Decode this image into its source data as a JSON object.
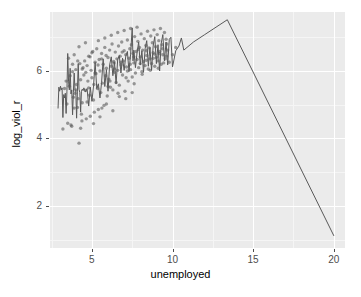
{
  "chart_data": {
    "type": "scatter",
    "title": "",
    "xlabel": "unemployed",
    "ylabel": "log_viol_r",
    "xlim": [
      2.4,
      20.7
    ],
    "ylim": [
      0.75,
      7.75
    ],
    "xticks": [
      5,
      10,
      15,
      20
    ],
    "yticks": [
      2,
      4,
      6
    ],
    "grid": true,
    "legend": "none",
    "theme": "grey",
    "panel_background": "#EBEBEB",
    "gridline_major_color": "#FFFFFF",
    "gridline_minor_color": "#F5F5F5",
    "point_color": "#4D4D4D",
    "point_opacity": 0.55,
    "point_radius": 1.7,
    "line_color": "#595959",
    "line_width": 1.0,
    "series": [
      {
        "name": "points",
        "type": "scatter",
        "points": [
          [
            3.2,
            4.28
          ],
          [
            3.45,
            5.02
          ],
          [
            3.5,
            4.45
          ],
          [
            3.55,
            6.38
          ],
          [
            3.6,
            5.55
          ],
          [
            3.7,
            4.4
          ],
          [
            3.75,
            4.36
          ],
          [
            3.8,
            5.98
          ],
          [
            3.85,
            5.22
          ],
          [
            3.9,
            6.48
          ],
          [
            3.95,
            5.34
          ],
          [
            4.0,
            6.04
          ],
          [
            4.05,
            5.6
          ],
          [
            4.1,
            4.92
          ],
          [
            4.15,
            5.18
          ],
          [
            4.2,
            3.86
          ],
          [
            4.25,
            6.22
          ],
          [
            4.3,
            5.74
          ],
          [
            4.35,
            4.72
          ],
          [
            4.4,
            5.06
          ],
          [
            4.45,
            6.1
          ],
          [
            4.5,
            5.88
          ],
          [
            4.55,
            6.3
          ],
          [
            4.6,
            5.42
          ],
          [
            4.65,
            4.58
          ],
          [
            4.7,
            6.16
          ],
          [
            4.75,
            5.7
          ],
          [
            4.8,
            6.44
          ],
          [
            4.85,
            5.28
          ],
          [
            4.9,
            4.66
          ],
          [
            4.95,
            6.02
          ],
          [
            5.0,
            5.8
          ],
          [
            5.05,
            6.58
          ],
          [
            5.1,
            5.14
          ],
          [
            5.15,
            4.78
          ],
          [
            5.2,
            6.26
          ],
          [
            5.25,
            5.92
          ],
          [
            5.3,
            6.66
          ],
          [
            5.35,
            5.48
          ],
          [
            5.4,
            4.86
          ],
          [
            5.45,
            6.34
          ],
          [
            5.5,
            6.0
          ],
          [
            5.55,
            5.36
          ],
          [
            5.6,
            6.52
          ],
          [
            5.65,
            5.64
          ],
          [
            5.7,
            6.2
          ],
          [
            5.75,
            4.98
          ],
          [
            5.8,
            6.7
          ],
          [
            5.85,
            5.86
          ],
          [
            5.9,
            6.08
          ],
          [
            5.95,
            5.26
          ],
          [
            6.0,
            6.4
          ],
          [
            6.05,
            5.76
          ],
          [
            6.1,
            6.62
          ],
          [
            6.15,
            5.52
          ],
          [
            6.2,
            6.14
          ],
          [
            6.25,
            6.8
          ],
          [
            6.3,
            5.44
          ],
          [
            6.35,
            6.28
          ],
          [
            6.4,
            5.96
          ],
          [
            6.45,
            6.56
          ],
          [
            6.5,
            5.66
          ],
          [
            6.55,
            6.36
          ],
          [
            6.6,
            6.02
          ],
          [
            6.65,
            6.74
          ],
          [
            6.7,
            5.58
          ],
          [
            6.75,
            6.44
          ],
          [
            6.8,
            6.18
          ],
          [
            6.85,
            6.86
          ],
          [
            6.9,
            5.88
          ],
          [
            6.95,
            6.3
          ],
          [
            7.0,
            6.6
          ],
          [
            7.05,
            5.4
          ],
          [
            7.1,
            6.48
          ],
          [
            7.15,
            6.12
          ],
          [
            7.2,
            6.92
          ],
          [
            7.25,
            5.7
          ],
          [
            7.3,
            6.38
          ],
          [
            7.35,
            6.66
          ],
          [
            7.4,
            6.04
          ],
          [
            7.45,
            6.78
          ],
          [
            7.5,
            5.82
          ],
          [
            7.55,
            6.52
          ],
          [
            7.6,
            6.24
          ],
          [
            7.65,
            7.02
          ],
          [
            7.7,
            5.94
          ],
          [
            7.75,
            6.58
          ],
          [
            7.8,
            6.34
          ],
          [
            7.85,
            6.88
          ],
          [
            7.9,
            6.1
          ],
          [
            7.95,
            6.7
          ],
          [
            8.0,
            6.42
          ],
          [
            8.05,
            7.1
          ],
          [
            8.1,
            5.98
          ],
          [
            8.15,
            6.62
          ],
          [
            8.2,
            6.28
          ],
          [
            8.25,
            6.96
          ],
          [
            8.3,
            6.16
          ],
          [
            8.35,
            6.76
          ],
          [
            8.4,
            6.46
          ],
          [
            8.45,
            7.18
          ],
          [
            8.5,
            6.06
          ],
          [
            8.55,
            6.68
          ],
          [
            8.6,
            6.36
          ],
          [
            8.65,
            7.04
          ],
          [
            8.7,
            6.22
          ],
          [
            8.75,
            6.84
          ],
          [
            8.8,
            6.54
          ],
          [
            8.85,
            7.22
          ],
          [
            8.9,
            6.14
          ],
          [
            8.95,
            6.72
          ],
          [
            9.0,
            6.4
          ],
          [
            9.05,
            7.08
          ],
          [
            9.1,
            6.3
          ],
          [
            9.15,
            6.9
          ],
          [
            9.2,
            6.58
          ],
          [
            9.25,
            7.26
          ],
          [
            9.3,
            6.2
          ],
          [
            9.35,
            6.78
          ],
          [
            9.4,
            6.48
          ],
          [
            9.5,
            7.14
          ],
          [
            9.55,
            6.36
          ],
          [
            9.6,
            6.94
          ],
          [
            9.7,
            6.62
          ],
          [
            9.8,
            6.26
          ],
          [
            3.3,
            5.48
          ],
          [
            3.65,
            5.86
          ],
          [
            4.12,
            6.3
          ],
          [
            4.38,
            4.52
          ],
          [
            4.62,
            5.96
          ],
          [
            4.88,
            6.42
          ],
          [
            5.12,
            5.6
          ],
          [
            5.38,
            6.18
          ],
          [
            5.62,
            4.9
          ],
          [
            5.88,
            6.46
          ],
          [
            6.12,
            5.7
          ],
          [
            6.38,
            6.24
          ],
          [
            6.62,
            5.34
          ],
          [
            6.88,
            6.56
          ],
          [
            7.12,
            5.8
          ],
          [
            7.38,
            6.2
          ],
          [
            7.62,
            5.62
          ],
          [
            7.88,
            6.64
          ],
          [
            8.12,
            5.9
          ],
          [
            8.38,
            6.32
          ],
          [
            8.62,
            6.02
          ],
          [
            8.88,
            6.5
          ],
          [
            9.12,
            6.08
          ],
          [
            9.38,
            6.66
          ],
          [
            9.62,
            6.44
          ],
          [
            3.9,
            4.9
          ],
          [
            4.3,
            4.3
          ],
          [
            4.7,
            5.08
          ],
          [
            5.1,
            4.44
          ],
          [
            5.5,
            4.64
          ],
          [
            5.9,
            5.02
          ],
          [
            6.3,
            4.82
          ],
          [
            6.7,
            5.24
          ],
          [
            7.1,
            5.18
          ],
          [
            7.5,
            5.36
          ],
          [
            4.2,
            6.72
          ],
          [
            4.6,
            6.84
          ],
          [
            5.0,
            6.54
          ],
          [
            5.4,
            6.9
          ],
          [
            5.8,
            6.98
          ],
          [
            6.2,
            7.06
          ],
          [
            6.6,
            7.14
          ],
          [
            7.0,
            7.2
          ],
          [
            7.4,
            7.26
          ],
          [
            7.8,
            7.3
          ],
          [
            3.4,
            5.7
          ],
          [
            3.8,
            6.2
          ],
          [
            4.0,
            5.44
          ],
          [
            4.4,
            6.06
          ],
          [
            4.8,
            5.5
          ],
          [
            5.2,
            5.94
          ],
          [
            5.6,
            6.36
          ],
          [
            6.0,
            5.54
          ],
          [
            6.4,
            6.06
          ],
          [
            6.8,
            6.26
          ],
          [
            7.2,
            6.0
          ],
          [
            7.6,
            6.42
          ],
          [
            8.0,
            6.22
          ],
          [
            8.4,
            6.6
          ],
          [
            8.8,
            6.38
          ],
          [
            9.2,
            6.52
          ],
          [
            9.45,
            6.24
          ],
          [
            9.65,
            6.8
          ],
          [
            10.0,
            6.48
          ],
          [
            10.2,
            6.7
          ]
        ]
      },
      {
        "name": "line",
        "type": "line",
        "points": [
          [
            2.9,
            4.9
          ],
          [
            2.95,
            5.52
          ],
          [
            3.0,
            5.4
          ],
          [
            3.05,
            5.55
          ],
          [
            3.1,
            5.44
          ],
          [
            3.15,
            5.5
          ],
          [
            3.2,
            4.62
          ],
          [
            3.25,
            5.3
          ],
          [
            3.3,
            5.2
          ],
          [
            3.35,
            5.34
          ],
          [
            3.4,
            4.74
          ],
          [
            3.45,
            5.4
          ],
          [
            3.5,
            6.52
          ],
          [
            3.55,
            5.7
          ],
          [
            3.6,
            5.44
          ],
          [
            3.65,
            6.08
          ],
          [
            3.7,
            5.32
          ],
          [
            3.75,
            5.44
          ],
          [
            3.8,
            4.7
          ],
          [
            3.85,
            5.36
          ],
          [
            3.9,
            5.94
          ],
          [
            3.95,
            5.44
          ],
          [
            4.0,
            5.42
          ],
          [
            4.05,
            4.6
          ],
          [
            4.1,
            5.38
          ],
          [
            4.15,
            6.22
          ],
          [
            4.2,
            5.46
          ],
          [
            4.25,
            5.36
          ],
          [
            4.3,
            4.78
          ],
          [
            4.35,
            5.4
          ],
          [
            4.4,
            5.46
          ],
          [
            4.45,
            5.42
          ],
          [
            4.5,
            5.5
          ],
          [
            4.55,
            5.44
          ],
          [
            4.6,
            5.38
          ],
          [
            4.7,
            5.48
          ],
          [
            4.8,
            4.96
          ],
          [
            4.9,
            5.52
          ],
          [
            5.0,
            5.1
          ],
          [
            5.1,
            5.56
          ],
          [
            5.2,
            6.26
          ],
          [
            5.3,
            5.48
          ],
          [
            5.4,
            5.62
          ],
          [
            5.5,
            5.2
          ],
          [
            5.6,
            5.66
          ],
          [
            5.7,
            6.36
          ],
          [
            5.8,
            5.54
          ],
          [
            5.9,
            6.04
          ],
          [
            6.0,
            5.4
          ],
          [
            6.1,
            6.18
          ],
          [
            6.2,
            6.42
          ],
          [
            6.3,
            5.86
          ],
          [
            6.4,
            6.26
          ],
          [
            6.5,
            5.62
          ],
          [
            6.6,
            6.34
          ],
          [
            6.7,
            6.46
          ],
          [
            6.8,
            5.94
          ],
          [
            6.9,
            6.38
          ],
          [
            7.0,
            6.02
          ],
          [
            7.1,
            6.44
          ],
          [
            7.2,
            6.58
          ],
          [
            7.3,
            5.98
          ],
          [
            7.4,
            6.5
          ],
          [
            7.5,
            7.28
          ],
          [
            7.55,
            6.3
          ],
          [
            7.6,
            6.62
          ],
          [
            7.7,
            6.1
          ],
          [
            7.8,
            6.54
          ],
          [
            7.9,
            6.86
          ],
          [
            8.0,
            6.18
          ],
          [
            8.1,
            6.6
          ],
          [
            8.2,
            5.96
          ],
          [
            8.3,
            6.66
          ],
          [
            8.4,
            6.9
          ],
          [
            8.5,
            6.14
          ],
          [
            8.6,
            6.7
          ],
          [
            8.7,
            6.02
          ],
          [
            8.8,
            6.74
          ],
          [
            8.9,
            7.02
          ],
          [
            9.0,
            6.22
          ],
          [
            9.1,
            6.78
          ],
          [
            9.2,
            6.0
          ],
          [
            9.3,
            6.82
          ],
          [
            9.4,
            7.08
          ],
          [
            9.5,
            6.3
          ],
          [
            9.6,
            6.86
          ],
          [
            9.7,
            6.18
          ],
          [
            9.8,
            6.94
          ],
          [
            9.9,
            7.0
          ],
          [
            10.0,
            6.12
          ],
          [
            10.2,
            6.6
          ],
          [
            10.4,
            6.74
          ],
          [
            10.55,
            6.98
          ],
          [
            10.7,
            6.62
          ],
          [
            11.3,
            6.86
          ],
          [
            12.0,
            7.08
          ],
          [
            12.7,
            7.3
          ],
          [
            13.4,
            7.52
          ],
          [
            20.0,
            1.12
          ]
        ]
      }
    ]
  }
}
